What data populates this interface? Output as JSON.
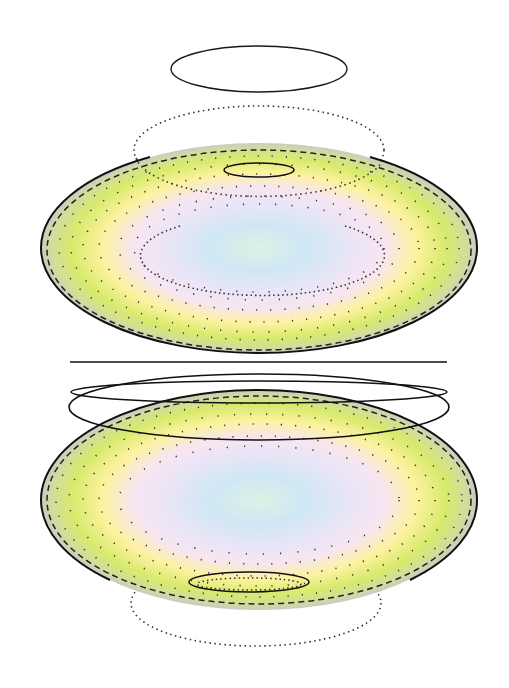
{
  "figure": {
    "type": "diagram",
    "text_labels": [],
    "colors": {
      "center": "#d9f0ea",
      "inner": "#cfe6f5",
      "mid": "#efe4f4",
      "yellow": "#fdf39a",
      "green": "#d4e86a",
      "rim": "#c8cfc4",
      "stroke": "#1a1a1a"
    },
    "upper_surface": {
      "center": [
        259,
        248
      ],
      "rx": 218,
      "ry": 105,
      "floating_outline": {
        "center": [
          259,
          69
        ],
        "rx": 88,
        "ry": 23
      },
      "cap_outline": {
        "center": [
          259,
          170
        ],
        "rx": 35,
        "ry": 7
      },
      "cap_dotted_ring": {
        "center": [
          259,
          150
        ],
        "rx": 125,
        "ry": 44
      },
      "inner_dotted_ring": {
        "center": [
          259,
          250
        ],
        "rx": 122,
        "ry": 42
      }
    },
    "divider_line": {
      "y": 362,
      "x1": 70,
      "x2": 447
    },
    "lower_surface": {
      "center": [
        259,
        500
      ],
      "rx": 218,
      "ry": 110,
      "flat_outline": {
        "center": [
          259,
          392
        ],
        "rx": 188,
        "ry": 11
      },
      "wide_outline": {
        "center": [
          259,
          407
        ],
        "rx": 190,
        "ry": 33
      },
      "cap_outline": {
        "center": [
          249,
          582
        ],
        "rx": 60,
        "ry": 10
      },
      "cap_dotted_ring": {
        "center": [
          256,
          603
        ],
        "rx": 125,
        "ry": 43
      }
    }
  }
}
